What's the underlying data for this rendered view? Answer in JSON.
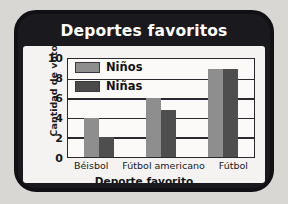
{
  "card": {
    "title": "Deportes favoritos"
  },
  "chart_data": {
    "type": "bar",
    "title": "Deportes favoritos",
    "xlabel": "Deporte favorito",
    "ylabel": "Cantidad de votos",
    "categories": [
      "Béisbol",
      "Fútbol americano",
      "Fútbol"
    ],
    "series": [
      {
        "name": "Niños",
        "values": [
          4,
          6,
          9
        ],
        "color": "#8e8e8e"
      },
      {
        "name": "Niñas",
        "values": [
          2,
          4.8,
          9
        ],
        "color": "#4e4e4e"
      }
    ],
    "ylim": [
      0,
      10
    ],
    "yticks": [
      10,
      8,
      6,
      4,
      2,
      0
    ],
    "grid": true,
    "legend_position": "top-left",
    "legend": [
      "Niños",
      "Niñas"
    ]
  }
}
